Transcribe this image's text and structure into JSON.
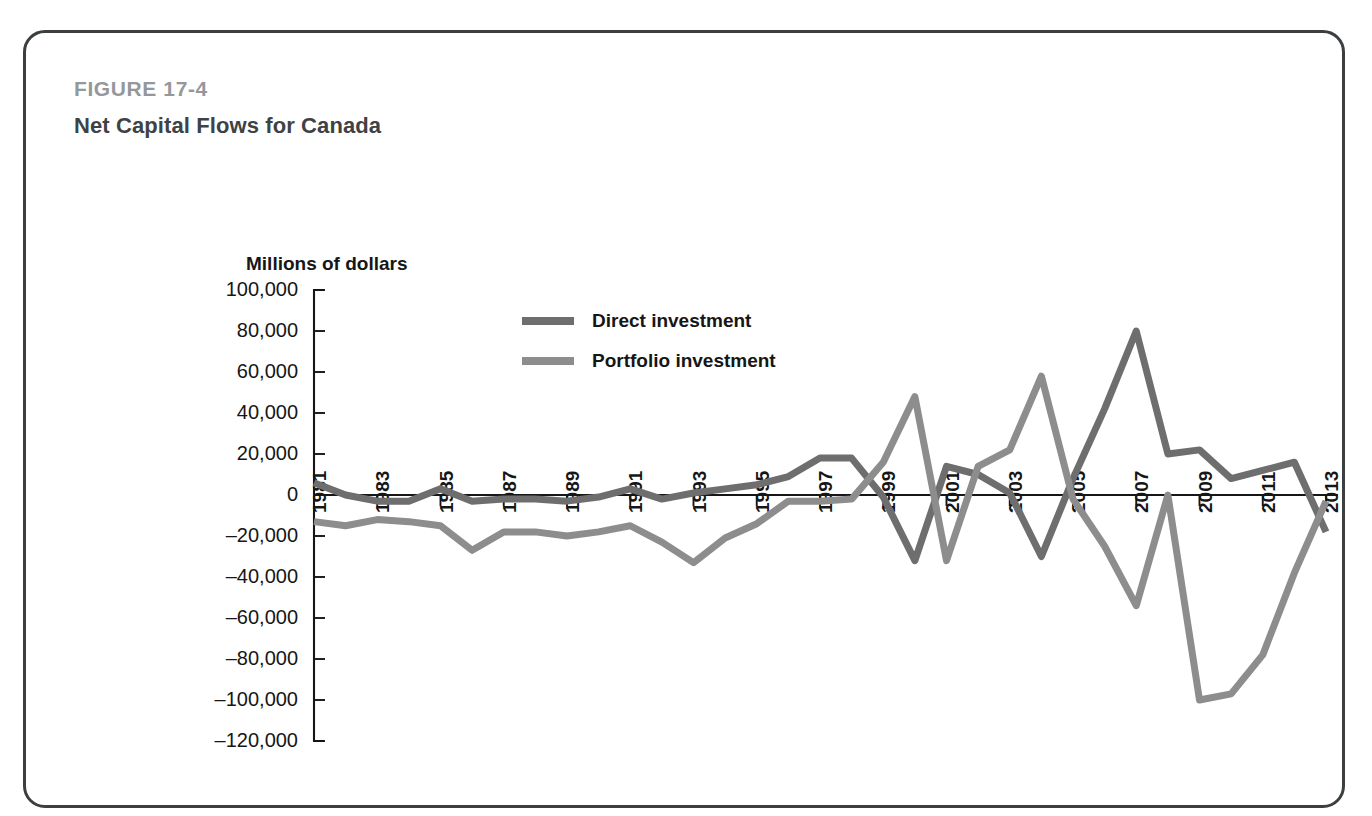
{
  "figure": {
    "number_label": "FIGURE 17-4",
    "title": "Net Capital Flows for Canada"
  },
  "colors": {
    "frame_border": "#3c3f41",
    "figure_number": "#95989b",
    "figure_title": "#3f4244",
    "axis": "#161616",
    "direct_investment": "#6e6e6e",
    "portfolio_investment": "#8d8d8d",
    "background": "#ffffff"
  },
  "chart_data": {
    "type": "line",
    "title": "Net Capital Flows for Canada",
    "subtitle": "",
    "ylabel": "Millions of dollars",
    "xlabel": "",
    "ylim": [
      -120000,
      100000
    ],
    "ytick_step": 20000,
    "ytick_labels": [
      "100,000",
      "80,000",
      "60,000",
      "40,000",
      "20,000",
      "0",
      "–20,000",
      "–40,000",
      "–60,000",
      "–80,000",
      "–100,000",
      "–120,000"
    ],
    "ytick_values": [
      100000,
      80000,
      60000,
      40000,
      20000,
      0,
      -20000,
      -40000,
      -60000,
      -80000,
      -100000,
      -120000
    ],
    "xlim": [
      1981,
      2013
    ],
    "x": [
      1981,
      1982,
      1983,
      1984,
      1985,
      1986,
      1987,
      1988,
      1989,
      1990,
      1991,
      1992,
      1993,
      1994,
      1995,
      1996,
      1997,
      1998,
      1999,
      2000,
      2001,
      2002,
      2003,
      2004,
      2005,
      2006,
      2007,
      2008,
      2009,
      2010,
      2011,
      2012,
      2013
    ],
    "xtick_labels_shown": [
      "1981",
      "1983",
      "1985",
      "1987",
      "1989",
      "1991",
      "1993",
      "1995",
      "1997",
      "1999",
      "2001",
      "2003",
      "2005",
      "2007",
      "2009",
      "2011",
      "2013"
    ],
    "xtick_label_rotation": -90,
    "grid": false,
    "zero_line": true,
    "legend_position": "inside-top-center",
    "series": [
      {
        "name": "Direct investment",
        "color": "#6e6e6e",
        "values": [
          6000,
          0,
          -3000,
          -3000,
          3000,
          -3000,
          -2000,
          -2000,
          -3000,
          -1000,
          3000,
          -2000,
          1000,
          3000,
          5000,
          9000,
          18000,
          18000,
          -1000,
          -32000,
          14000,
          10000,
          1000,
          -30000,
          8000,
          42000,
          80000,
          20000,
          22000,
          8000,
          12000,
          16000,
          -18000
        ]
      },
      {
        "name": "Portfolio investment",
        "color": "#8d8d8d",
        "values": [
          -13000,
          -15000,
          -12000,
          -13000,
          -15000,
          -27000,
          -18000,
          -18000,
          -20000,
          -18000,
          -15000,
          -23000,
          -33000,
          -21000,
          -14000,
          -3000,
          -3000,
          -2000,
          16000,
          48000,
          -32000,
          14000,
          22000,
          58000,
          -2000,
          -25000,
          -54000,
          0,
          -100000,
          -97000,
          -78000,
          -38000,
          -3000
        ]
      }
    ]
  },
  "legend": {
    "entries": [
      {
        "label": "Direct investment",
        "color": "#6e6e6e"
      },
      {
        "label": "Portfolio investment",
        "color": "#8d8d8d"
      }
    ]
  }
}
